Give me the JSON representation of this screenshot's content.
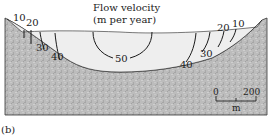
{
  "title": {
    "line1": "Flow velocity",
    "line2": "(m per year)"
  },
  "contours": [
    {
      "value": "10",
      "side": "left"
    },
    {
      "value": "20",
      "side": "left"
    },
    {
      "value": "30",
      "side": "left"
    },
    {
      "value": "40",
      "side": "left"
    },
    {
      "value": "50",
      "side": "center"
    },
    {
      "value": "40",
      "side": "right"
    },
    {
      "value": "30",
      "side": "right"
    },
    {
      "value": "20",
      "side": "right"
    },
    {
      "value": "10",
      "side": "right"
    }
  ],
  "scale_bar": {
    "start": "0",
    "end": "200",
    "unit": "m"
  },
  "panel_label": "(b)",
  "colors": {
    "rock": "#b9b9b9",
    "ice": "#eeeeee",
    "line": "#1a1a1a"
  }
}
